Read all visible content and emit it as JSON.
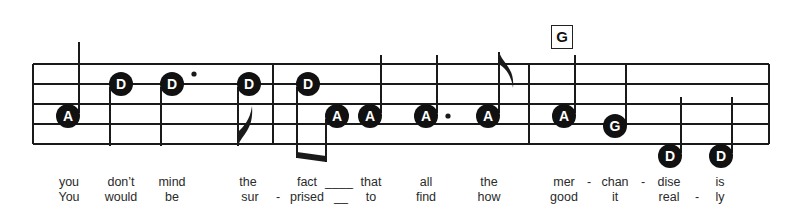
{
  "chord": {
    "label": "G",
    "x": 561
  },
  "staff": {
    "left": 33,
    "right": 769,
    "lines_y": [
      64,
      84,
      104,
      124,
      144
    ],
    "barlines_x": [
      33,
      273,
      529,
      769
    ]
  },
  "notes": [
    {
      "name": "A",
      "x": 68,
      "y": 116,
      "stem": "up",
      "stem_top": 42,
      "dot": false
    },
    {
      "name": "D",
      "x": 121,
      "y": 84,
      "stem": "down",
      "stem_bottom": 146,
      "dot": false
    },
    {
      "name": "D",
      "x": 172,
      "y": 84,
      "stem": "down",
      "stem_bottom": 146,
      "dot": true
    },
    {
      "name": "D",
      "x": 249,
      "y": 84,
      "stem": "down",
      "stem_bottom": 146,
      "dot": false,
      "flag": "down"
    },
    {
      "name": "D",
      "x": 308,
      "y": 84,
      "stem": "down",
      "stem_bottom": 158,
      "dot": false,
      "beam_to": 1
    },
    {
      "name": "A",
      "x": 337,
      "y": 116,
      "stem": "down",
      "stem_bottom": 162,
      "dot": false
    },
    {
      "name": "A",
      "x": 370,
      "y": 116,
      "stem": "up",
      "stem_top": 55,
      "dot": false
    },
    {
      "name": "A",
      "x": 426,
      "y": 116,
      "stem": "up",
      "stem_top": 55,
      "dot": true
    },
    {
      "name": "A",
      "x": 488,
      "y": 116,
      "stem": "up",
      "stem_top": 52,
      "dot": false,
      "flag": "up"
    },
    {
      "name": "A",
      "x": 564,
      "y": 116,
      "stem": "up",
      "stem_top": 55,
      "dot": false
    },
    {
      "name": "G",
      "x": 615,
      "y": 126,
      "stem": "up",
      "stem_top": 65,
      "dot": false
    },
    {
      "name": "D",
      "x": 670,
      "y": 156,
      "stem": "up",
      "stem_top": 97,
      "dot": false
    },
    {
      "name": "D",
      "x": 721,
      "y": 156,
      "stem": "up",
      "stem_top": 97,
      "dot": false
    }
  ],
  "lyrics": {
    "line1": [
      {
        "text": "you",
        "x": 69
      },
      {
        "text": "don’t",
        "x": 121
      },
      {
        "text": "mind",
        "x": 172
      },
      {
        "text": "the",
        "x": 248
      },
      {
        "text": "fact",
        "x": 307
      },
      {
        "text": "____",
        "x": 339
      },
      {
        "text": "that",
        "x": 371
      },
      {
        "text": "all",
        "x": 426
      },
      {
        "text": "the",
        "x": 489
      },
      {
        "text": "mer",
        "x": 564
      },
      {
        "text": "-",
        "x": 589
      },
      {
        "text": "chan",
        "x": 615
      },
      {
        "text": "-",
        "x": 643
      },
      {
        "text": "dise",
        "x": 669
      },
      {
        "text": "is",
        "x": 720
      }
    ],
    "line2": [
      {
        "text": "You",
        "x": 69
      },
      {
        "text": "would",
        "x": 121
      },
      {
        "text": "be",
        "x": 172
      },
      {
        "text": "sur",
        "x": 250
      },
      {
        "text": "-",
        "x": 278
      },
      {
        "text": "prised",
        "x": 307
      },
      {
        "text": "__",
        "x": 341
      },
      {
        "text": "to",
        "x": 371
      },
      {
        "text": "find",
        "x": 426
      },
      {
        "text": "how",
        "x": 489
      },
      {
        "text": "good",
        "x": 564
      },
      {
        "text": "it",
        "x": 615
      },
      {
        "text": "real",
        "x": 669
      },
      {
        "text": "-",
        "x": 697
      },
      {
        "text": "ly",
        "x": 720
      }
    ]
  }
}
